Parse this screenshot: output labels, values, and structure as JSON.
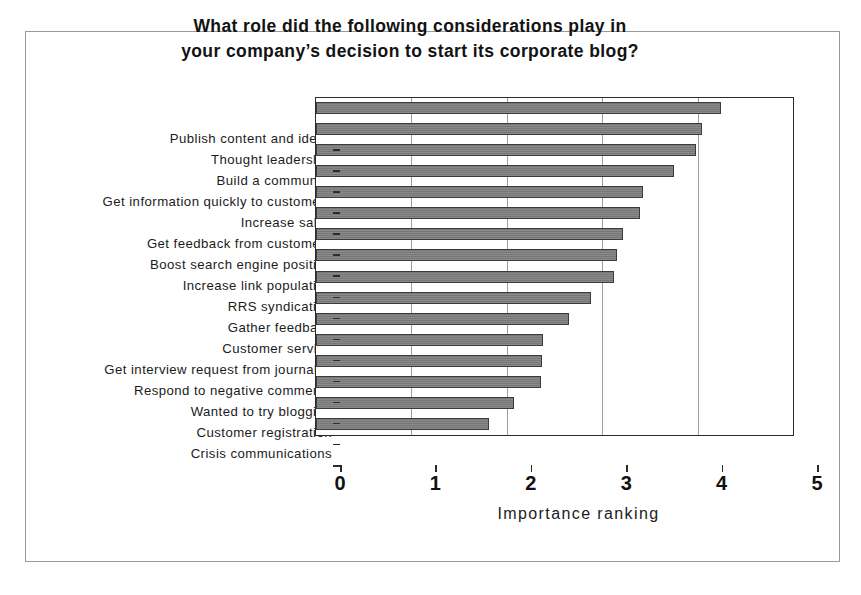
{
  "figure": {
    "title_line_1": "What role did the following considerations play in",
    "title_line_2": "your company’s decision to start its corporate blog?",
    "frame_color": "#9a9a9a",
    "bar_fill_color": "#7d7d7d",
    "bar_edge_color": "#3c3c3c",
    "gridline_color": "#9d9d9d",
    "axis_color": "#2b2b2b"
  },
  "chart_data": {
    "type": "bar",
    "orientation": "horizontal",
    "title": "What role did the following considerations play in your company’s decision to start its corporate blog?",
    "xlabel": "Importance ranking",
    "ylabel": "",
    "xlim": [
      0,
      5
    ],
    "xticks": [
      0,
      1,
      2,
      3,
      4,
      5
    ],
    "xtick_labels": [
      "0",
      "1",
      "2",
      "3",
      "4",
      "5"
    ],
    "grid": true,
    "grid_axis": "x",
    "legend": false,
    "categories": [
      "Publish content and ideas",
      "Thought leadership",
      "Build a community",
      "Get information quickly to customers",
      "Increase sales",
      "Get feedback from customers",
      "Boost search engine position",
      "Increase link population",
      "RRS syndication",
      "Gather feedback",
      "Customer service",
      "Get interview request from journalist",
      "Respond to negative comments",
      "Wanted to try blogging",
      "Customer registration",
      "Crisis communications"
    ],
    "values": [
      4.25,
      4.05,
      3.98,
      3.75,
      3.43,
      3.4,
      3.22,
      3.15,
      3.12,
      2.88,
      2.65,
      2.38,
      2.37,
      2.36,
      2.08,
      1.81
    ]
  }
}
